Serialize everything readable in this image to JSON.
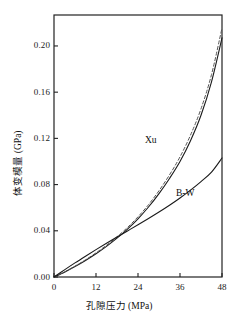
{
  "chart_data": {
    "type": "line",
    "title": "",
    "xlabel": "孔隙压力 (MPa)",
    "ylabel": "体变模量 (GPa)",
    "xlim": [
      0,
      48
    ],
    "ylim": [
      0,
      0.2268
    ],
    "xticks": [
      0,
      12,
      24,
      36,
      48
    ],
    "xtick_labels": [
      "0",
      "12",
      "24",
      "36",
      "48"
    ],
    "yticks": [
      0.0,
      0.04,
      0.08,
      0.12,
      0.16,
      0.2
    ],
    "ytick_labels": [
      "0.00",
      "0.04",
      "0.08",
      "0.12",
      "0.16",
      "0.20"
    ],
    "grid": false,
    "legend": "inline-annotations",
    "frame": "box",
    "series": [
      {
        "name": "Xu",
        "style": "solid",
        "color": "#1a1a1a",
        "x": [
          0,
          3,
          6,
          9,
          12,
          15,
          18,
          21,
          24,
          27,
          30,
          33,
          36,
          39,
          42,
          45,
          48
        ],
        "y": [
          0.0,
          0.0042,
          0.009,
          0.0143,
          0.0201,
          0.0265,
          0.0336,
          0.0415,
          0.0504,
          0.0606,
          0.0722,
          0.0853,
          0.1,
          0.118,
          0.14,
          0.169,
          0.207
        ]
      },
      {
        "name": "Xu-dashed",
        "style": "dashed",
        "color": "#555555",
        "x": [
          0,
          3,
          6,
          9,
          12,
          15,
          18,
          21,
          24,
          27,
          30,
          33,
          36,
          39,
          42,
          45,
          48
        ],
        "y": [
          0.0,
          0.0044,
          0.0094,
          0.0149,
          0.0209,
          0.0275,
          0.0348,
          0.0429,
          0.0521,
          0.0626,
          0.0747,
          0.0884,
          0.104,
          0.1228,
          0.1456,
          0.1752,
          0.2155
        ]
      },
      {
        "name": "B-W",
        "style": "solid",
        "color": "#1a1a1a",
        "x": [
          0,
          3,
          6,
          9,
          12,
          15,
          18,
          21,
          24,
          27,
          30,
          33,
          36,
          39,
          42,
          45,
          48
        ],
        "y": [
          0.0,
          0.0062,
          0.0122,
          0.018,
          0.0237,
          0.0292,
          0.0346,
          0.0399,
          0.0452,
          0.0506,
          0.0562,
          0.0621,
          0.0684,
          0.0752,
          0.0826,
          0.0908,
          0.103
        ]
      }
    ],
    "annotations": [
      {
        "text": "Xu",
        "x": 29.0,
        "y": 0.118
      },
      {
        "text": "B-W",
        "x": 38.0,
        "y": 0.072
      }
    ]
  }
}
